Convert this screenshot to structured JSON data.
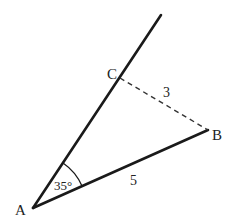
{
  "diagram": {
    "type": "geometry",
    "points": {
      "A": {
        "label": "A"
      },
      "B": {
        "label": "B"
      },
      "C": {
        "label": "C"
      }
    },
    "angle_A": {
      "label": "35°",
      "value_deg": 35
    },
    "segments": {
      "AB": {
        "label": "5",
        "style": "solid"
      },
      "CB": {
        "label": "3",
        "style": "dashed"
      },
      "AC_ray": {
        "style": "solid",
        "extends_beyond": "C"
      }
    },
    "colors": {
      "stroke": "#1a1a1a",
      "text": "#222222",
      "background": "#ffffff"
    }
  }
}
